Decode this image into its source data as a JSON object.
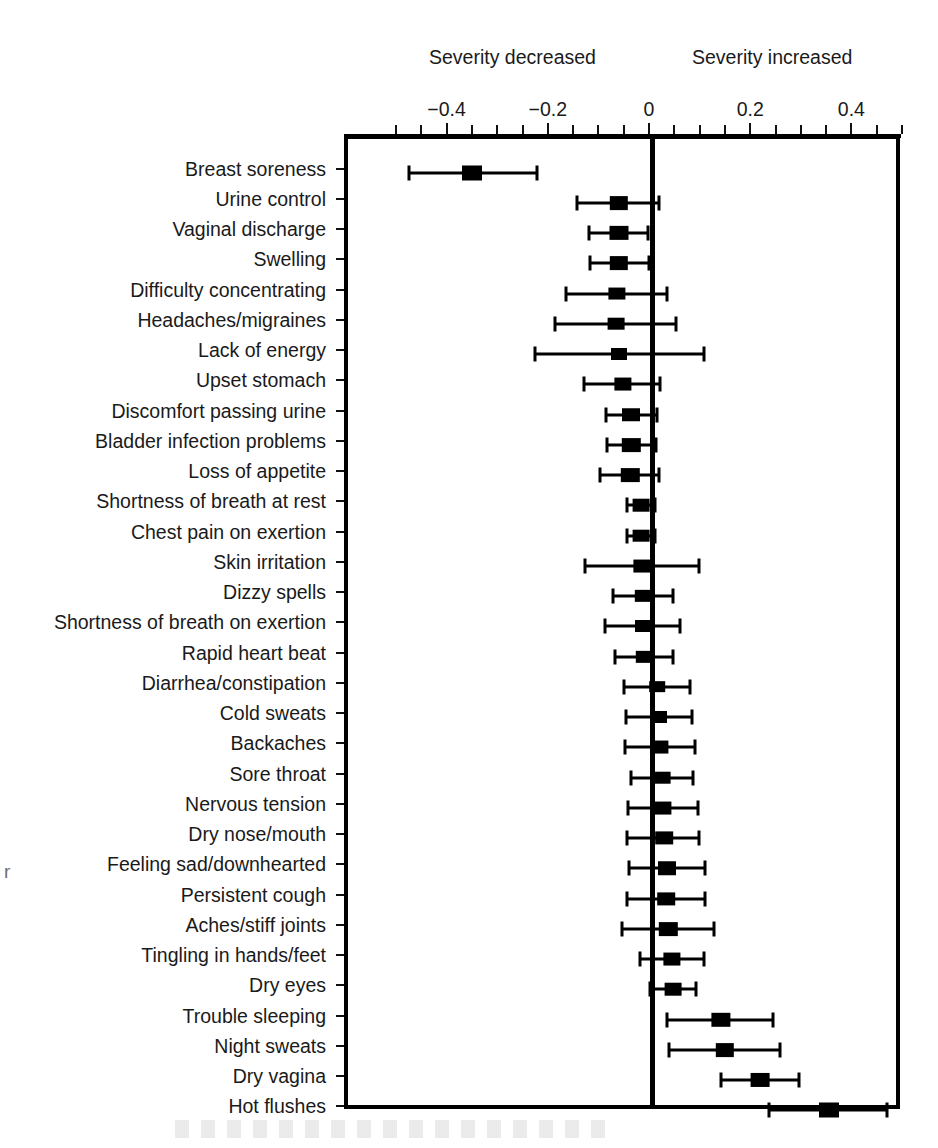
{
  "header": {
    "decreased_label": "Severity decreased",
    "increased_label": "Severity increased"
  },
  "artifacts": {
    "left_edge_fragment": "r"
  },
  "chart_data": {
    "type": "scatter",
    "subtype": "forest-plot",
    "title": "",
    "xlabel": "",
    "ylabel": "",
    "xlim": [
      -0.6,
      0.5
    ],
    "grid": false,
    "zero_reference_line": 0,
    "legend": "none",
    "axis_annotations": {
      "left": "Severity decreased",
      "right": "Severity increased"
    },
    "tick_labels": [
      "-0.4",
      "-0.2",
      "0",
      "0.2",
      "0.4"
    ],
    "tick_values": [
      -0.4,
      -0.2,
      0,
      0.2,
      0.4
    ],
    "minor_tick_values": [
      -0.5,
      -0.45,
      -0.35,
      -0.3,
      -0.25,
      -0.15,
      -0.1,
      -0.05,
      0.05,
      0.1,
      0.15,
      0.25,
      0.3,
      0.35,
      0.45,
      0.5
    ],
    "categories": [
      "Breast soreness",
      "Urine control",
      "Vaginal discharge",
      "Swelling",
      "Difficulty concentrating",
      "Headaches/migraines",
      "Lack of energy",
      "Upset stomach",
      "Discomfort passing urine",
      "Bladder infection problems",
      "Loss of appetite",
      "Shortness of breath at rest",
      "Chest pain on exertion",
      "Skin irritation",
      "Dizzy spells",
      "Shortness of breath on exertion",
      "Rapid heart beat",
      "Diarrhea/constipation",
      "Cold sweats",
      "Backaches",
      "Sore throat",
      "Nervous tension",
      "Dry nose/mouth",
      "Feeling sad/downhearted",
      "Persistent cough",
      "Aches/stiff joints",
      "Tingling in hands/feet",
      "Dry eyes",
      "Trouble sleeping",
      "Night sweats",
      "Dry vagina",
      "Hot flushes"
    ],
    "estimates": [
      -0.358,
      -0.067,
      -0.068,
      -0.067,
      -0.071,
      -0.073,
      -0.067,
      -0.059,
      -0.043,
      -0.043,
      -0.045,
      -0.024,
      -0.024,
      -0.022,
      -0.02,
      -0.02,
      -0.018,
      0.008,
      0.012,
      0.014,
      0.018,
      0.02,
      0.022,
      0.028,
      0.026,
      0.03,
      0.038,
      0.04,
      0.134,
      0.142,
      0.212,
      0.348
    ],
    "ci_low": [
      -0.482,
      -0.15,
      -0.126,
      -0.124,
      -0.172,
      -0.193,
      -0.233,
      -0.136,
      -0.093,
      -0.091,
      -0.104,
      -0.051,
      -0.051,
      -0.134,
      -0.079,
      -0.095,
      -0.075,
      -0.057,
      -0.053,
      -0.055,
      -0.043,
      -0.049,
      -0.051,
      -0.047,
      -0.051,
      -0.061,
      -0.025,
      -0.005,
      0.028,
      0.032,
      0.134,
      0.229
    ],
    "ci_high": [
      -0.229,
      0.012,
      -0.01,
      -0.008,
      0.028,
      0.046,
      0.1,
      0.014,
      0.008,
      0.006,
      0.012,
      0.004,
      0.004,
      0.091,
      0.04,
      0.053,
      0.04,
      0.073,
      0.077,
      0.083,
      0.079,
      0.089,
      0.091,
      0.103,
      0.103,
      0.121,
      0.101,
      0.085,
      0.238,
      0.251,
      0.289,
      0.462
    ],
    "marker_weights": [
      1.0,
      0.92,
      0.95,
      0.92,
      0.86,
      0.84,
      0.8,
      0.86,
      0.9,
      0.92,
      0.92,
      0.84,
      0.84,
      0.86,
      0.82,
      0.8,
      0.82,
      0.78,
      0.8,
      0.86,
      0.84,
      0.86,
      0.88,
      0.9,
      0.88,
      0.92,
      0.86,
      0.84,
      0.96,
      0.92,
      0.94,
      1.0
    ]
  }
}
